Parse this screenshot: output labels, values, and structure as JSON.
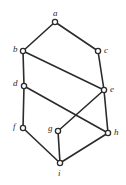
{
  "figure": {
    "kind": "undirected-graph-diagram",
    "width": 126,
    "height": 185,
    "background_color": "#ffffff",
    "edge_color": "#2b2b2b",
    "vertex_stroke_color": "#2b2b2b",
    "vertex_fill_color": "#ffffff",
    "label_color": "#2b2b2b",
    "edge_width": 1.6,
    "vertex_radius": 2.6,
    "vertex_stroke_width": 1.3
  },
  "graph": {
    "vertices": [
      {
        "id": "a",
        "label": "a",
        "x": 55,
        "y": 22,
        "label_x": 53,
        "label_y": 9,
        "label_align": "center"
      },
      {
        "id": "b",
        "label": "b",
        "x": 23,
        "y": 51,
        "label_x": 13,
        "label_y": 45,
        "label_align": "right"
      },
      {
        "id": "c",
        "label": "c",
        "x": 98,
        "y": 51,
        "label_x": 104,
        "label_y": 46,
        "label_align": "left"
      },
      {
        "id": "d",
        "label": "d",
        "x": 24,
        "y": 86,
        "label_x": 13,
        "label_y": 79,
        "label_align": "right"
      },
      {
        "id": "e",
        "label": "e",
        "x": 104,
        "y": 90,
        "label_x": 110,
        "label_y": 85,
        "label_align": "left"
      },
      {
        "id": "f",
        "label": "f",
        "x": 23,
        "y": 128,
        "label_x": 13,
        "label_y": 122,
        "label_align": "right"
      },
      {
        "id": "g",
        "label": "g",
        "x": 58,
        "y": 131,
        "label_x": 48,
        "label_y": 124,
        "label_align": "right"
      },
      {
        "id": "h",
        "label": "h",
        "x": 108,
        "y": 133,
        "label_x": 114,
        "label_y": 128,
        "label_align": "left"
      },
      {
        "id": "i",
        "label": "i",
        "x": 60,
        "y": 163,
        "label_x": 58,
        "label_y": 169,
        "label_align": "center"
      }
    ],
    "edges": [
      {
        "from": "a",
        "to": "b"
      },
      {
        "from": "a",
        "to": "c"
      },
      {
        "from": "b",
        "to": "d"
      },
      {
        "from": "b",
        "to": "e"
      },
      {
        "from": "c",
        "to": "e"
      },
      {
        "from": "d",
        "to": "f"
      },
      {
        "from": "d",
        "to": "h"
      },
      {
        "from": "e",
        "to": "g"
      },
      {
        "from": "e",
        "to": "h"
      },
      {
        "from": "f",
        "to": "i"
      },
      {
        "from": "g",
        "to": "i"
      },
      {
        "from": "h",
        "to": "i"
      }
    ]
  }
}
